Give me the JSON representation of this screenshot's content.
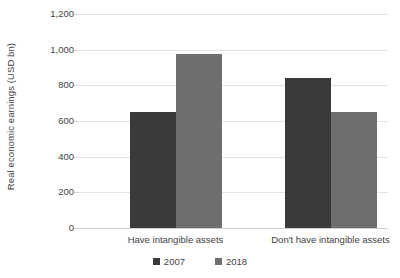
{
  "chart_data": {
    "type": "bar",
    "title": "",
    "subtitle": "",
    "xlabel": "",
    "ylabel": "Real economic earnings (USD bn)",
    "categories": [
      "Have intangible assets",
      "Don't have intangible assets"
    ],
    "series": [
      {
        "name": "2007",
        "color": "#3a3a3a",
        "values": [
          650,
          840
        ]
      },
      {
        "name": "2018",
        "color": "#6e6e6e",
        "values": [
          975,
          650
        ]
      }
    ],
    "ylim": [
      0,
      1200
    ],
    "yticks": [
      0,
      200,
      400,
      600,
      800,
      1000,
      1200
    ],
    "ytick_labels": [
      "0",
      "200",
      "400",
      "600",
      "800",
      "1,000",
      "1,200"
    ],
    "grid": true,
    "legend_position": "bottom"
  },
  "legend": {
    "items": [
      {
        "label": "2007",
        "color": "#3a3a3a"
      },
      {
        "label": "2018",
        "color": "#6e6e6e"
      }
    ]
  },
  "colors": {
    "series_2007": "#3a3a3a",
    "series_2018": "#6e6e6e",
    "gridline": "#e2e2e2",
    "text": "#3f3f3f",
    "background": "#ffffff"
  }
}
